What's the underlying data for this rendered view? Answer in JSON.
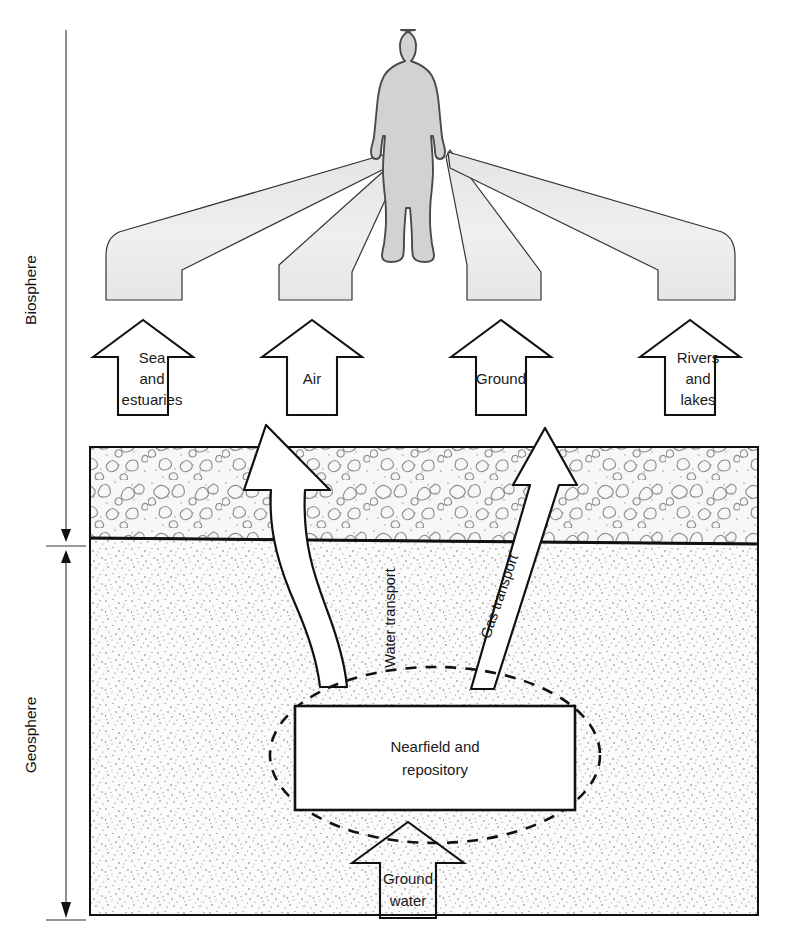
{
  "figure": {
    "background_color": "#ffffff",
    "line_color": "#111111",
    "human_fill": "#d2d2d2",
    "cone_fill": "#ececec",
    "rock_layer_fill": "#f6f6f6",
    "soil_layer_fill": "#fafafa"
  },
  "axis": {
    "biosphere_label": "Biosphere",
    "geosphere_label": "Geosphere"
  },
  "biosphere": {
    "human_name": "human-figure",
    "pathways": [
      {
        "id": "sea",
        "label_lines": [
          "Sea",
          "and",
          "estuaries"
        ]
      },
      {
        "id": "air",
        "label_lines": [
          "Air"
        ]
      },
      {
        "id": "ground",
        "label_lines": [
          "Ground"
        ]
      },
      {
        "id": "rivers",
        "label_lines": [
          "Rivers",
          "and",
          "lakes"
        ]
      }
    ]
  },
  "geosphere": {
    "repository_label_lines": [
      "Nearfield and",
      "repository"
    ],
    "groundwater_label_lines": [
      "Ground",
      "water"
    ],
    "transport_arrows": [
      {
        "id": "water",
        "label": "Water transport"
      },
      {
        "id": "gas",
        "label": "Gas transport"
      }
    ]
  }
}
